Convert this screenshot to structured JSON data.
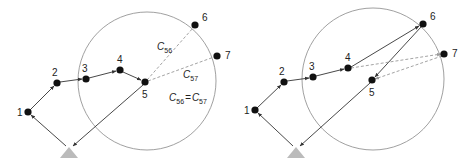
{
  "panels": [
    {
      "name": "left",
      "circle": {
        "cx": 147,
        "cy": 81,
        "r": 69
      },
      "depot": {
        "x": 69,
        "y": 148
      },
      "nodes": [
        {
          "id": "1",
          "x": 28,
          "y": 112,
          "lx": 17,
          "ly": 116
        },
        {
          "id": "2",
          "x": 57,
          "y": 83,
          "lx": 52,
          "ly": 75
        },
        {
          "id": "3",
          "x": 86,
          "y": 79,
          "lx": 82,
          "ly": 71
        },
        {
          "id": "4",
          "x": 120,
          "y": 70,
          "lx": 117,
          "ly": 62
        },
        {
          "id": "5",
          "x": 145,
          "y": 82,
          "lx": 143,
          "ly": 97
        },
        {
          "id": "6",
          "x": 195,
          "y": 25,
          "lx": 202,
          "ly": 20
        },
        {
          "id": "7",
          "x": 217,
          "y": 56,
          "lx": 225,
          "ly": 58
        }
      ],
      "cost_labels": {
        "c56": {
          "text": "C",
          "sub": "56"
        },
        "c57": {
          "text": "C",
          "sub": "57"
        },
        "equation": {
          "left": "C",
          "left_sub": "56",
          "op": "=",
          "right": "C",
          "right_sub": "57"
        }
      }
    },
    {
      "name": "right",
      "circle": {
        "cx": 373,
        "cy": 79,
        "r": 71
      },
      "depot": {
        "x": 296,
        "y": 148
      },
      "nodes": [
        {
          "id": "1",
          "x": 255,
          "y": 110,
          "lx": 244,
          "ly": 114
        },
        {
          "id": "2",
          "x": 284,
          "y": 82,
          "lx": 279,
          "ly": 74
        },
        {
          "id": "3",
          "x": 313,
          "y": 77,
          "lx": 309,
          "ly": 69
        },
        {
          "id": "4",
          "x": 348,
          "y": 68,
          "lx": 345,
          "ly": 60
        },
        {
          "id": "5",
          "x": 372,
          "y": 80,
          "lx": 369,
          "ly": 95
        },
        {
          "id": "6",
          "x": 423,
          "y": 24,
          "lx": 430,
          "ly": 19
        },
        {
          "id": "7",
          "x": 444,
          "y": 54,
          "lx": 452,
          "ly": 56
        }
      ]
    }
  ],
  "colors": {
    "node": "#111111",
    "edge": "#333333",
    "dashed": "#999999",
    "circle": "#888888",
    "depot": "#bbbbbb"
  }
}
